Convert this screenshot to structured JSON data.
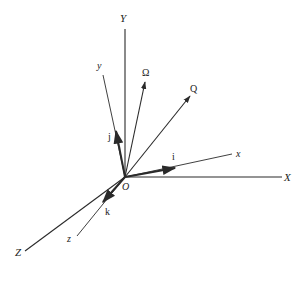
{
  "diagram": {
    "origin": {
      "label": "O",
      "x": 125,
      "y": 177
    },
    "colors": {
      "line": "#2a2a2a",
      "background": "#ffffff"
    },
    "fixed_axes": [
      {
        "id": "X",
        "label": "X",
        "end": [
          282,
          177
        ],
        "label_pos": [
          284,
          181
        ]
      },
      {
        "id": "Y",
        "label": "Y",
        "end": [
          125,
          29
        ],
        "label_pos": [
          120,
          22
        ]
      },
      {
        "id": "Z",
        "label": "Z",
        "end": [
          25,
          251
        ],
        "label_pos": [
          15,
          256
        ]
      }
    ],
    "moving_axes": [
      {
        "id": "x",
        "label": "x",
        "end": [
          232,
          154
        ],
        "label_pos": [
          236,
          157
        ]
      },
      {
        "id": "y",
        "label": "y",
        "end": [
          103,
          75
        ],
        "label_pos": [
          97,
          69
        ]
      },
      {
        "id": "z",
        "label": "z",
        "end": [
          77,
          236
        ],
        "label_pos": [
          67,
          242
        ]
      }
    ],
    "unit_vectors": [
      {
        "id": "i",
        "label": "i",
        "end": [
          175,
          168
        ],
        "label_pos": [
          172,
          160
        ]
      },
      {
        "id": "j",
        "label": "j",
        "end": [
          116,
          131
        ],
        "label_pos": [
          108,
          140
        ]
      },
      {
        "id": "k",
        "label": "k",
        "end": [
          103,
          202
        ],
        "label_pos": [
          105,
          215
        ]
      }
    ],
    "vectors": [
      {
        "id": "Omega",
        "label": "Ω",
        "end": [
          145,
          82
        ],
        "label_pos": [
          142,
          76
        ]
      },
      {
        "id": "Q",
        "label": "Q",
        "end": [
          190,
          96
        ],
        "label_pos": [
          190,
          92
        ]
      }
    ]
  }
}
